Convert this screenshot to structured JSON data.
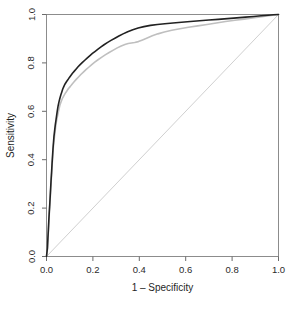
{
  "chart_data": {
    "type": "line",
    "title": "",
    "xlabel": "1 – Specificity",
    "ylabel": "Sensitivity",
    "xlim": [
      0.0,
      1.0
    ],
    "ylim": [
      0.0,
      1.0
    ],
    "grid": false,
    "legend": "none",
    "xticks": [
      "0.0",
      "0.2",
      "0.4",
      "0.6",
      "0.8",
      "1.0"
    ],
    "yticks": [
      "0.0",
      "0.2",
      "0.4",
      "0.6",
      "0.8",
      "1.0"
    ],
    "xtick_values": [
      0.0,
      0.2,
      0.4,
      0.6,
      0.8,
      1.0
    ],
    "ytick_values": [
      0.0,
      0.2,
      0.4,
      0.6,
      0.8,
      1.0
    ],
    "series": [
      {
        "name": "roc-curve-black",
        "color": "#222222",
        "width": 1.6,
        "points": [
          [
            0.0,
            0.0
          ],
          [
            0.004,
            0.035
          ],
          [
            0.006,
            0.075
          ],
          [
            0.008,
            0.11
          ],
          [
            0.01,
            0.15
          ],
          [
            0.012,
            0.185
          ],
          [
            0.014,
            0.215
          ],
          [
            0.016,
            0.25
          ],
          [
            0.018,
            0.285
          ],
          [
            0.02,
            0.32
          ],
          [
            0.022,
            0.35
          ],
          [
            0.024,
            0.385
          ],
          [
            0.026,
            0.415
          ],
          [
            0.028,
            0.445
          ],
          [
            0.03,
            0.47
          ],
          [
            0.032,
            0.495
          ],
          [
            0.035,
            0.52
          ],
          [
            0.038,
            0.545
          ],
          [
            0.041,
            0.565
          ],
          [
            0.044,
            0.585
          ],
          [
            0.047,
            0.605
          ],
          [
            0.05,
            0.622
          ],
          [
            0.054,
            0.64
          ],
          [
            0.058,
            0.655
          ],
          [
            0.062,
            0.668
          ],
          [
            0.066,
            0.68
          ],
          [
            0.07,
            0.692
          ],
          [
            0.075,
            0.703
          ],
          [
            0.08,
            0.713
          ],
          [
            0.086,
            0.722
          ],
          [
            0.092,
            0.73
          ],
          [
            0.098,
            0.739
          ],
          [
            0.105,
            0.748
          ],
          [
            0.112,
            0.757
          ],
          [
            0.12,
            0.766
          ],
          [
            0.128,
            0.775
          ],
          [
            0.136,
            0.784
          ],
          [
            0.145,
            0.793
          ],
          [
            0.155,
            0.802
          ],
          [
            0.165,
            0.811
          ],
          [
            0.175,
            0.82
          ],
          [
            0.186,
            0.829
          ],
          [
            0.198,
            0.839
          ],
          [
            0.21,
            0.848
          ],
          [
            0.222,
            0.857
          ],
          [
            0.235,
            0.866
          ],
          [
            0.248,
            0.875
          ],
          [
            0.262,
            0.884
          ],
          [
            0.278,
            0.893
          ],
          [
            0.295,
            0.902
          ],
          [
            0.312,
            0.911
          ],
          [
            0.33,
            0.92
          ],
          [
            0.35,
            0.929
          ],
          [
            0.372,
            0.937
          ],
          [
            0.395,
            0.944
          ],
          [
            0.42,
            0.95
          ],
          [
            0.448,
            0.955
          ],
          [
            0.478,
            0.959
          ],
          [
            0.51,
            0.962
          ],
          [
            0.545,
            0.965
          ],
          [
            0.582,
            0.968
          ],
          [
            0.62,
            0.971
          ],
          [
            0.66,
            0.974
          ],
          [
            0.7,
            0.977
          ],
          [
            0.74,
            0.98
          ],
          [
            0.78,
            0.983
          ],
          [
            0.82,
            0.986
          ],
          [
            0.858,
            0.989
          ],
          [
            0.892,
            0.992
          ],
          [
            0.925,
            0.995
          ],
          [
            0.955,
            0.997
          ],
          [
            0.978,
            0.999
          ],
          [
            1.0,
            1.0
          ]
        ]
      },
      {
        "name": "roc-curve-gray",
        "color": "#bfbfbf",
        "width": 1.6,
        "points": [
          [
            0.0,
            0.0
          ],
          [
            0.004,
            0.03
          ],
          [
            0.006,
            0.068
          ],
          [
            0.008,
            0.102
          ],
          [
            0.01,
            0.14
          ],
          [
            0.012,
            0.175
          ],
          [
            0.014,
            0.205
          ],
          [
            0.016,
            0.24
          ],
          [
            0.018,
            0.275
          ],
          [
            0.02,
            0.308
          ],
          [
            0.022,
            0.338
          ],
          [
            0.024,
            0.372
          ],
          [
            0.026,
            0.402
          ],
          [
            0.028,
            0.432
          ],
          [
            0.03,
            0.458
          ],
          [
            0.033,
            0.484
          ],
          [
            0.036,
            0.508
          ],
          [
            0.039,
            0.532
          ],
          [
            0.042,
            0.553
          ],
          [
            0.046,
            0.574
          ],
          [
            0.05,
            0.592
          ],
          [
            0.054,
            0.61
          ],
          [
            0.058,
            0.626
          ],
          [
            0.063,
            0.64
          ],
          [
            0.068,
            0.652
          ],
          [
            0.074,
            0.663
          ],
          [
            0.08,
            0.673
          ],
          [
            0.087,
            0.683
          ],
          [
            0.094,
            0.693
          ],
          [
            0.102,
            0.702
          ],
          [
            0.11,
            0.712
          ],
          [
            0.119,
            0.722
          ],
          [
            0.128,
            0.732
          ],
          [
            0.138,
            0.742
          ],
          [
            0.148,
            0.752
          ],
          [
            0.159,
            0.762
          ],
          [
            0.17,
            0.772
          ],
          [
            0.182,
            0.782
          ],
          [
            0.195,
            0.793
          ],
          [
            0.208,
            0.803
          ],
          [
            0.222,
            0.813
          ],
          [
            0.237,
            0.823
          ],
          [
            0.253,
            0.833
          ],
          [
            0.27,
            0.843
          ],
          [
            0.288,
            0.853
          ],
          [
            0.305,
            0.862
          ],
          [
            0.322,
            0.87
          ],
          [
            0.338,
            0.876
          ],
          [
            0.352,
            0.88
          ],
          [
            0.366,
            0.882
          ],
          [
            0.38,
            0.884
          ],
          [
            0.396,
            0.888
          ],
          [
            0.414,
            0.895
          ],
          [
            0.434,
            0.903
          ],
          [
            0.456,
            0.912
          ],
          [
            0.48,
            0.92
          ],
          [
            0.508,
            0.928
          ],
          [
            0.54,
            0.935
          ],
          [
            0.575,
            0.941
          ],
          [
            0.612,
            0.947
          ],
          [
            0.652,
            0.953
          ],
          [
            0.692,
            0.959
          ],
          [
            0.732,
            0.965
          ],
          [
            0.772,
            0.971
          ],
          [
            0.812,
            0.976
          ],
          [
            0.852,
            0.981
          ],
          [
            0.888,
            0.986
          ],
          [
            0.92,
            0.99
          ],
          [
            0.95,
            0.994
          ],
          [
            0.975,
            0.997
          ],
          [
            1.0,
            1.0
          ]
        ]
      }
    ],
    "reference_line": {
      "name": "chance-diagonal",
      "color": "#d0d0d0",
      "width": 1.0,
      "points": [
        [
          0.0,
          0.0
        ],
        [
          1.0,
          1.0
        ]
      ]
    }
  }
}
